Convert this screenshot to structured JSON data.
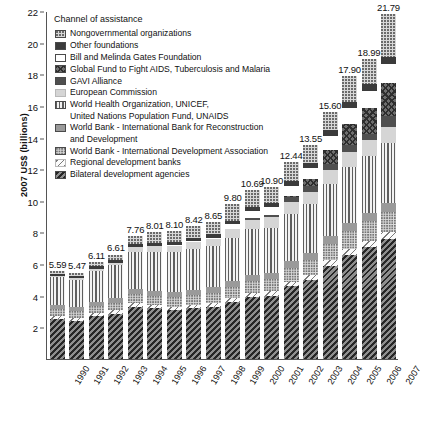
{
  "chart_data": {
    "type": "bar",
    "subtype": "stacked-bar",
    "title": "",
    "xlabel": "",
    "ylabel": "2007 US$ (billions)",
    "ylim": [
      0,
      22
    ],
    "ytick_values": [
      2,
      4,
      6,
      8,
      10,
      12,
      14,
      16,
      18,
      20,
      22
    ],
    "ytick_labels": [
      "2",
      "4",
      "6",
      "8",
      "10",
      "12",
      "14",
      "16",
      "18",
      "20",
      "22"
    ],
    "grid": false,
    "legend_position": "inside-top-left",
    "legend_title": "Channel of assistance",
    "categories": [
      "1990",
      "1991",
      "1992",
      "1993",
      "1994",
      "1995",
      "1996",
      "1997",
      "1998",
      "1999",
      "2000",
      "2001",
      "2002",
      "2003",
      "2004",
      "2005",
      "2006",
      "2007"
    ],
    "totals": [
      5.59,
      5.47,
      6.11,
      6.61,
      7.76,
      8.01,
      8.1,
      8.42,
      8.65,
      9.8,
      10.69,
      10.9,
      12.44,
      13.55,
      15.6,
      17.9,
      18.99,
      21.79
    ],
    "total_labels": [
      "5.59",
      "5.47",
      "6.11",
      "6.61",
      "7.76",
      "8.01",
      "8.10",
      "8.42",
      "8.65",
      "9.80",
      "10.69",
      "10.90",
      "12.44",
      "13.55",
      "15.60",
      "17.90",
      "18.99",
      "21.79"
    ],
    "series": [
      {
        "name": "Bilateral development agencies",
        "key": "bilateral",
        "pattern": "dense-diagonal-dark",
        "values": [
          2.55,
          2.4,
          2.7,
          2.85,
          3.3,
          3.2,
          3.1,
          3.2,
          3.3,
          3.6,
          3.9,
          4.0,
          4.6,
          5.0,
          5.9,
          6.6,
          7.1,
          7.6
        ]
      },
      {
        "name": "Regional development banks",
        "key": "regional",
        "pattern": "sparse-diagonal-light",
        "values": [
          0.18,
          0.22,
          0.2,
          0.22,
          0.25,
          0.22,
          0.22,
          0.24,
          0.25,
          0.26,
          0.28,
          0.28,
          0.3,
          0.32,
          0.34,
          0.36,
          0.38,
          0.4
        ]
      },
      {
        "name": "World Bank - International Development Association",
        "key": "ida",
        "pattern": "fine-dots",
        "values": [
          0.42,
          0.4,
          0.45,
          0.48,
          0.55,
          0.58,
          0.6,
          0.62,
          0.64,
          0.7,
          0.78,
          0.8,
          0.88,
          0.95,
          1.05,
          1.15,
          1.22,
          1.3
        ]
      },
      {
        "name": "World Bank - International Bank for Reconstruction and Development",
        "key": "ibrd",
        "pattern": "solid-gray",
        "values": [
          0.26,
          0.25,
          0.28,
          0.3,
          0.34,
          0.33,
          0.32,
          0.33,
          0.34,
          0.36,
          0.38,
          0.38,
          0.42,
          0.44,
          0.48,
          0.52,
          0.55,
          0.58
        ]
      },
      {
        "name": "World Health Organization, UNICEF, United Nations Population Fund, UNAIDS",
        "key": "who",
        "pattern": "vertical-stripes",
        "values": [
          1.75,
          1.75,
          1.95,
          2.1,
          2.35,
          2.45,
          2.5,
          2.55,
          2.6,
          2.75,
          2.85,
          2.85,
          3.0,
          3.1,
          3.3,
          3.5,
          3.6,
          3.75
        ]
      },
      {
        "name": "European Commission",
        "key": "ec",
        "pattern": "solid-light-gray",
        "values": [
          0.1,
          0.12,
          0.13,
          0.14,
          0.3,
          0.38,
          0.42,
          0.46,
          0.48,
          0.55,
          0.62,
          0.64,
          0.72,
          0.78,
          0.86,
          0.94,
          0.98,
          1.05
        ]
      },
      {
        "name": "GAVI Alliance",
        "key": "gavi",
        "pattern": "solid-dark-gray",
        "values": [
          0.0,
          0.0,
          0.0,
          0.0,
          0.0,
          0.0,
          0.0,
          0.0,
          0.0,
          0.0,
          0.12,
          0.18,
          0.3,
          0.34,
          0.4,
          0.48,
          0.42,
          0.7
        ]
      },
      {
        "name": "Global Fund to Fight AIDS, Tuberculosis and Malaria",
        "key": "globalfund",
        "pattern": "crosshatch",
        "values": [
          0.0,
          0.0,
          0.0,
          0.0,
          0.0,
          0.0,
          0.0,
          0.0,
          0.0,
          0.0,
          0.0,
          0.0,
          0.1,
          0.45,
          0.92,
          1.3,
          1.65,
          2.1
        ]
      },
      {
        "name": "Bill and Melinda Gates Foundation",
        "key": "gates",
        "pattern": "white",
        "values": [
          0.0,
          0.0,
          0.0,
          0.0,
          0.0,
          0.0,
          0.02,
          0.04,
          0.06,
          0.3,
          0.45,
          0.48,
          0.62,
          0.7,
          0.85,
          1.0,
          1.05,
          1.15
        ]
      },
      {
        "name": "Other foundations",
        "key": "otherfound",
        "pattern": "solid-black",
        "values": [
          0.13,
          0.13,
          0.15,
          0.17,
          0.2,
          0.2,
          0.2,
          0.21,
          0.22,
          0.24,
          0.26,
          0.26,
          0.3,
          0.32,
          0.36,
          0.4,
          0.42,
          0.46
        ]
      },
      {
        "name": "Nongovernmental organizations",
        "key": "ngo",
        "pattern": "dots",
        "values": [
          0.2,
          0.2,
          0.25,
          0.35,
          0.47,
          0.65,
          0.72,
          0.77,
          0.76,
          1.04,
          1.05,
          1.03,
          1.2,
          1.15,
          1.14,
          1.65,
          1.62,
          2.7
        ]
      }
    ]
  },
  "axis": {
    "ylabel": "2007 US$ (billions)"
  },
  "legend": {
    "title": "Channel of assistance",
    "items": [
      {
        "label": "Nongovernmental organizations",
        "key": "ngo",
        "cont": ""
      },
      {
        "label": "Other foundations",
        "key": "otherfound",
        "cont": ""
      },
      {
        "label": "Bill and Melinda Gates Foundation",
        "key": "gates",
        "cont": ""
      },
      {
        "label": "Global Fund to Fight AIDS, Tuberculosis and Malaria",
        "key": "globalfund",
        "cont": ""
      },
      {
        "label": "GAVI Alliance",
        "key": "gavi",
        "cont": ""
      },
      {
        "label": "European Commission",
        "key": "ec",
        "cont": ""
      },
      {
        "label": "World Health Organization, UNICEF,",
        "key": "who",
        "cont": "United Nations Population Fund, UNAIDS"
      },
      {
        "label": "World Bank - International Bank for Reconstruction",
        "key": "ibrd",
        "cont": "and Development"
      },
      {
        "label": "World Bank - International Development Association",
        "key": "ida",
        "cont": ""
      },
      {
        "label": "Regional development banks",
        "key": "regional",
        "cont": ""
      },
      {
        "label": "Bilateral development agencies",
        "key": "bilateral",
        "cont": ""
      }
    ]
  }
}
